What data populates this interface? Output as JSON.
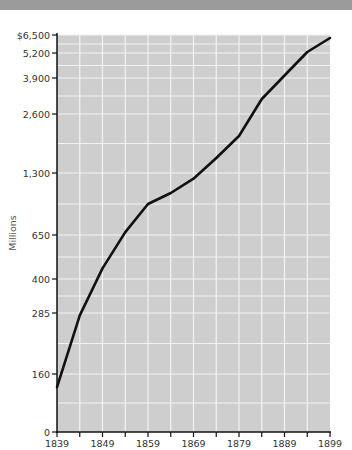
{
  "chart_data": {
    "type": "line",
    "title": "",
    "xlabel": "",
    "ylabel": "Millions",
    "y_scale": "nonlinear (custom tick spacing)",
    "x": [
      1839,
      1844,
      1849,
      1854,
      1859,
      1864,
      1869,
      1874,
      1879,
      1884,
      1889,
      1894,
      1899
    ],
    "series": [
      {
        "name": "Value (millions of dollars)",
        "values": [
          124,
          280,
          460,
          680,
          975,
          1090,
          1240,
          1630,
          2115,
          3140,
          4030,
          5270,
          6280
        ]
      }
    ],
    "x_ticks": [
      "1839",
      "1849",
      "1859",
      "1869",
      "1879",
      "1889",
      "1899"
    ],
    "y_ticks": [
      "$6,500",
      "5,200",
      "3,900",
      "2,600",
      "1,300",
      "650",
      "400",
      "285",
      "160",
      "0"
    ],
    "xlim": [
      1839,
      1899
    ],
    "ylim": [
      0,
      6500
    ],
    "grid": true,
    "legend": null,
    "colors": {
      "plot_background": "#cecece",
      "grid": "#f2f2f2",
      "line": "#111111",
      "top_band": "#9b9b9b"
    }
  }
}
